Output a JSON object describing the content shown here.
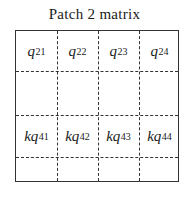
{
  "title": "Patch 2 matrix",
  "grid": {
    "rows": 4,
    "cols": 4
  },
  "cells": [
    {
      "row": 0,
      "col": 0,
      "base": "q",
      "sub": "21"
    },
    {
      "row": 0,
      "col": 1,
      "base": "q",
      "sub": "22"
    },
    {
      "row": 0,
      "col": 2,
      "base": "q",
      "sub": "23"
    },
    {
      "row": 0,
      "col": 3,
      "base": "q",
      "sub": "24"
    },
    {
      "row": 2,
      "col": 0,
      "base": "kq",
      "sub": "41"
    },
    {
      "row": 2,
      "col": 1,
      "base": "kq",
      "sub": "42"
    },
    {
      "row": 2,
      "col": 2,
      "base": "kq",
      "sub": "43"
    },
    {
      "row": 2,
      "col": 3,
      "base": "kq",
      "sub": "44"
    }
  ]
}
